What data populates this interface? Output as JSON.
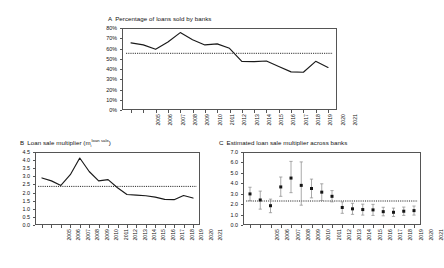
{
  "figure": {
    "background": "#ffffff",
    "line_color": "#1a1a1a",
    "marker_color": "#151515",
    "errorbar_color": "#8d8d8d"
  },
  "panels": {
    "a": {
      "label": "A",
      "title": "Percentage of loans sold by banks"
    },
    "b": {
      "label": "B",
      "title_prefix": "Loan sale multiplier (m",
      "title_sub": "i",
      "title_sup": "loan sale",
      "title_suffix": ")"
    },
    "c": {
      "label": "C",
      "title": "Estimated loan sale multiplier across banks"
    }
  },
  "chart_data": [
    {
      "type": "line",
      "panel": "A",
      "title": "Percentage of loans sold by banks",
      "xlabel": "",
      "ylabel": "",
      "grid": false,
      "legend": "none",
      "ylim": [
        0,
        0.8
      ],
      "ytick_labels": [
        "0%",
        "10%",
        "20%",
        "30%",
        "40%",
        "50%",
        "60%",
        "70%",
        "80%"
      ],
      "ytick_values": [
        0,
        0.1,
        0.2,
        0.3,
        0.4,
        0.5,
        0.6,
        0.7,
        0.8
      ],
      "categories": [
        "2005",
        "2006",
        "2007",
        "2008",
        "2009",
        "2010",
        "2011",
        "2012",
        "2013",
        "2014",
        "2015",
        "2016",
        "2017",
        "2018",
        "2019",
        "2020",
        "2021"
      ],
      "values": [
        0.655,
        0.635,
        0.592,
        0.663,
        0.755,
        0.685,
        0.635,
        0.645,
        0.602,
        0.475,
        0.472,
        0.478,
        0.425,
        0.372,
        0.368,
        0.475,
        0.415
      ],
      "reference_line": {
        "label": "average",
        "value": 0.553
      }
    },
    {
      "type": "line",
      "panel": "B",
      "title": "Loan sale multiplier (m_i^{loan sale})",
      "xlabel": "",
      "ylabel": "",
      "grid": false,
      "legend": "none",
      "ylim": [
        0.0,
        4.5
      ],
      "ytick_labels": [
        "0.0",
        "0.5",
        "1.0",
        "1.5",
        "2.0",
        "2.5",
        "3.0",
        "3.5",
        "4.0",
        "4.5"
      ],
      "ytick_values": [
        0.0,
        0.5,
        1.0,
        1.5,
        2.0,
        2.5,
        3.0,
        3.5,
        4.0,
        4.5
      ],
      "categories": [
        "2005",
        "2006",
        "2007",
        "2008",
        "2009",
        "2010",
        "2011",
        "2012",
        "2013",
        "2014",
        "2015",
        "2016",
        "2017",
        "2018",
        "2019",
        "2020",
        "2021"
      ],
      "values": [
        2.9,
        2.72,
        2.44,
        3.1,
        4.13,
        3.3,
        2.72,
        2.8,
        2.3,
        1.88,
        1.84,
        1.8,
        1.72,
        1.58,
        1.56,
        1.82,
        1.66
      ],
      "reference_line": {
        "label": "average",
        "value": 2.38
      }
    },
    {
      "type": "scatter",
      "panel": "C",
      "title": "Estimated loan sale multiplier across banks",
      "xlabel": "",
      "ylabel": "",
      "grid": false,
      "legend": "none",
      "ylim": [
        0.0,
        7.0
      ],
      "ytick_labels": [
        "0.0",
        "1.0",
        "2.0",
        "3.0",
        "4.0",
        "5.0",
        "6.0",
        "7.0"
      ],
      "ytick_values": [
        0.0,
        1.0,
        2.0,
        3.0,
        4.0,
        5.0,
        6.0,
        7.0
      ],
      "categories": [
        "2005",
        "2006",
        "2007",
        "2008",
        "2009",
        "2010",
        "2011",
        "2012",
        "2013",
        "2014",
        "2015",
        "2016",
        "2017",
        "2018",
        "2019",
        "2020",
        "2021"
      ],
      "values": [
        2.98,
        2.4,
        1.85,
        3.65,
        4.5,
        3.8,
        3.5,
        3.15,
        2.75,
        1.68,
        1.55,
        1.48,
        1.45,
        1.28,
        1.22,
        1.32,
        1.38
      ],
      "error_low": [
        2.35,
        1.52,
        1.18,
        2.75,
        3.1,
        1.9,
        2.6,
        2.35,
        2.22,
        1.12,
        1.02,
        0.95,
        0.92,
        0.88,
        0.82,
        0.92,
        0.95
      ],
      "error_high": [
        3.62,
        3.25,
        2.48,
        4.6,
        6.1,
        6.05,
        4.4,
        3.95,
        3.3,
        2.22,
        2.08,
        2.0,
        1.98,
        1.7,
        1.62,
        1.72,
        1.82
      ],
      "reference_line": {
        "label": "average",
        "value": 2.3
      }
    }
  ]
}
